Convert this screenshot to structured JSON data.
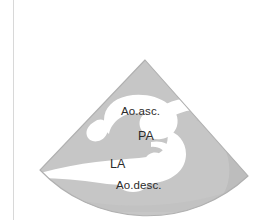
{
  "figure": {
    "kind": "ultrasound-sector-schematic",
    "modality_name": "echocardiography",
    "view_name": "suprasternal / short-axis aortic view",
    "background_color": "#ffffff",
    "rule_color": "#d8d8d8"
  },
  "sector": {
    "apex_x": 145,
    "apex_y": 60,
    "left_corner_x": 40,
    "left_corner_y": 170,
    "right_corner_x": 248,
    "right_corner_y": 176,
    "arc_bottom_y": 206,
    "tissue_fill_color": "#c6c6c6",
    "lumen_fill_color": "#ffffff",
    "edge_color": "#b4b4b4"
  },
  "labels": [
    {
      "id": "ao-asc",
      "text": "Ao.asc.",
      "expansion": "ascending aorta",
      "x": 121,
      "y": 106
    },
    {
      "id": "pa",
      "text": "PA",
      "expansion": "pulmonary artery",
      "x": 138,
      "y": 130
    },
    {
      "id": "la",
      "text": "LA",
      "expansion": "left atrium",
      "x": 110,
      "y": 158
    },
    {
      "id": "ao-desc",
      "text": "Ao.desc.",
      "expansion": "descending aorta",
      "x": 116,
      "y": 180
    }
  ],
  "text_color": "#2b2b2b"
}
